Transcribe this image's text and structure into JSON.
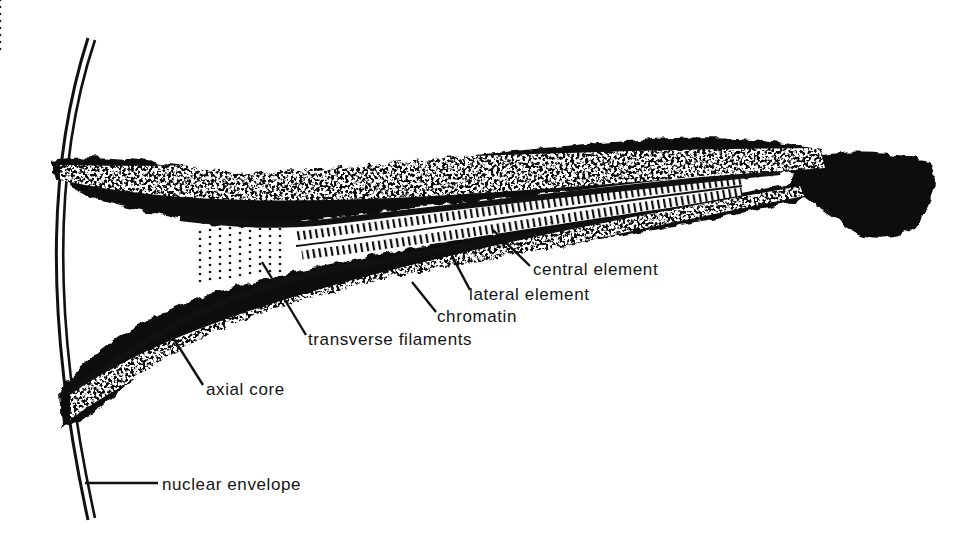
{
  "figure": {
    "labels": {
      "central_element": "central element",
      "lateral_element": "lateral element",
      "chromatin": "chromatin",
      "transverse_filaments": "transverse filaments",
      "axial_core": "axial core",
      "nuclear_envelope": "nuclear envelope"
    },
    "colors": {
      "ink": "#111111",
      "paper": "#ffffff"
    }
  }
}
